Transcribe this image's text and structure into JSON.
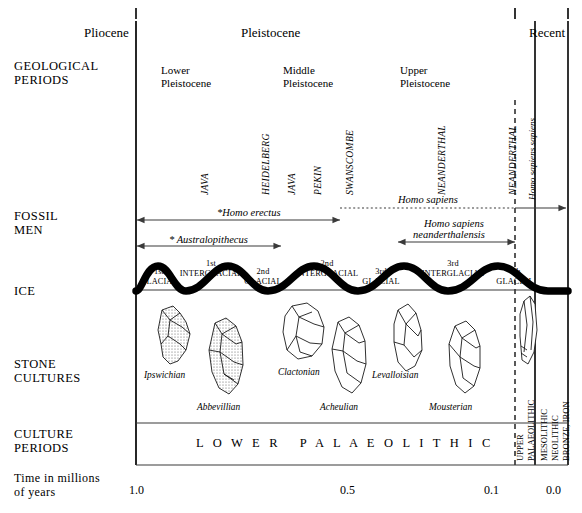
{
  "figure": {
    "axis_label": "Time in millions\nof years",
    "axis_label_line1": "Time in millions",
    "axis_label_line2": "of years",
    "ticks": [
      {
        "value": "1.0",
        "x": 0.0
      },
      {
        "value": "0.5",
        "x": 0.5
      },
      {
        "value": "0.1",
        "x": 0.9
      },
      {
        "value": "0.0",
        "x": 1.0
      }
    ]
  },
  "row_labels": {
    "geological": "GEOLOGICAL\nPERIODS",
    "geological_l1": "GEOLOGICAL",
    "geological_l2": "PERIODS",
    "fossil_l1": "FOSSIL",
    "fossil_l2": "MEN",
    "ice": "ICE",
    "stone_l1": "STONE",
    "stone_l2": "CULTURES",
    "culture_l1": "CULTURE",
    "culture_l2": "PERIODS"
  },
  "epochs": {
    "pliocene": "Pliocene",
    "pleistocene": "Pleistocene",
    "recent": "Recent"
  },
  "subdivisions": [
    {
      "line1": "Lower",
      "line2": "Pleistocene"
    },
    {
      "line1": "Middle",
      "line2": "Pleistocene"
    },
    {
      "line1": "Upper",
      "line2": "Pleistocene"
    }
  ],
  "fossil_names": [
    {
      "label": "JAVA",
      "style": "caps-italic"
    },
    {
      "label": "HEIDELBERG",
      "style": "caps-italic"
    },
    {
      "label": "JAVA",
      "style": "caps-italic"
    },
    {
      "label": "PEKIN",
      "style": "caps-italic"
    },
    {
      "label": "SWANSCOMBE",
      "style": "caps-italic"
    },
    {
      "label": "NEANDERTHAL",
      "style": "caps-italic"
    },
    {
      "label": "NEANDERTHAL",
      "style": "caps-italic"
    },
    {
      "label": "Homo sapiens sapiens",
      "style": "mixed-italic"
    }
  ],
  "fossil_ranges": [
    {
      "label": "*Homo erectus"
    },
    {
      "label": "Homo sapiens"
    },
    {
      "label": "Homo sapiens\nneanderthalensis",
      "line1": "Homo sapiens",
      "line2": "neanderthalensis"
    },
    {
      "label": "* Australopithecus"
    }
  ],
  "ice_ages": {
    "glacials": [
      {
        "l1": "1st",
        "l2": "GLACIAL"
      },
      {
        "l1": "2nd",
        "l2": "GLACIAL"
      },
      {
        "l1": "3rd",
        "l2": "GLACIAL"
      },
      {
        "l1": "4th",
        "l2": "GLACIAL"
      }
    ],
    "interglacials": [
      {
        "l1": "1st",
        "l2": "INTERGLACIAL"
      },
      {
        "l1": "2nd",
        "l2": "INTERGLACIAL"
      },
      {
        "l1": "3rd",
        "l2": "INTERGLACIAL"
      }
    ]
  },
  "stone_cultures": [
    {
      "label": "Ipswichian"
    },
    {
      "label": "Abbevillian"
    },
    {
      "label": "Clactonian"
    },
    {
      "label": "Acheulian"
    },
    {
      "label": "Levalloisian"
    },
    {
      "label": "Mousterian"
    }
  ],
  "culture_periods": {
    "lower": "L O W E R   P A L A E O L I T H I C",
    "upper_l1": "UPPER",
    "upper_l2": "PALAEOLITHIC",
    "late_l1": "MESOLITHIC",
    "late_l2": "NEOLITHIC",
    "late_l3": "BRONZE, IRON"
  },
  "colors": {
    "ink": "#000000",
    "background": "#ffffff",
    "thin_rule": "#3a3a3a"
  }
}
